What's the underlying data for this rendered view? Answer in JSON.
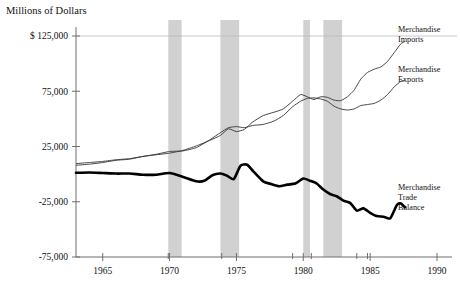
{
  "chart_data": {
    "type": "line",
    "title": "",
    "ylabel": "Millions of Dollars",
    "xlabel": "",
    "ylim": [
      -75000,
      125000
    ],
    "xlim": [
      1963,
      1990
    ],
    "grid": false,
    "legend_position": "right-inline",
    "y_ticks": [
      {
        "value": 125000,
        "label": "$ 125,000"
      },
      {
        "value": 75000,
        "label": "75,000"
      },
      {
        "value": 25000,
        "label": "25,000"
      },
      {
        "value": -25000,
        "label": "-25,000"
      },
      {
        "value": -75000,
        "label": "-75,000"
      }
    ],
    "x_ticks": [
      {
        "value": 1965,
        "label": "1965"
      },
      {
        "value": 1970,
        "label": "1970"
      },
      {
        "value": 1975,
        "label": "1975"
      },
      {
        "value": 1980,
        "label": "1980"
      },
      {
        "value": 1985,
        "label": "1985"
      },
      {
        "value": 1990,
        "label": "1990"
      }
    ],
    "x_minor_ticks": [
      1969.9,
      1973.9,
      1979.2,
      1980.6,
      1984.0,
      1984.8
    ],
    "recession_bands": [
      {
        "start": 1969.9,
        "end": 1970.9
      },
      {
        "start": 1973.8,
        "end": 1975.2
      },
      {
        "start": 1980.0,
        "end": 1980.5
      },
      {
        "start": 1981.5,
        "end": 1982.9
      }
    ],
    "series": [
      {
        "name": "Merchandise Imports",
        "label_lines": [
          "Merchandise",
          "Imports"
        ],
        "style": "thin",
        "x": [
          1963.0,
          1964.0,
          1965.0,
          1966.0,
          1967.0,
          1968.0,
          1969.0,
          1970.0,
          1971.0,
          1972.0,
          1973.0,
          1973.8,
          1974.4,
          1975.0,
          1975.6,
          1976.2,
          1977.0,
          1977.8,
          1978.5,
          1979.2,
          1979.8,
          1980.3,
          1980.8,
          1981.3,
          1981.8,
          1982.3,
          1982.8,
          1983.3,
          1983.8,
          1984.3,
          1984.8,
          1985.3,
          1985.8,
          1986.3,
          1986.8,
          1987.3,
          1987.6
        ],
        "y": [
          8000,
          9000,
          10500,
          12500,
          13500,
          16000,
          17500,
          19000,
          21500,
          25500,
          30500,
          35000,
          41000,
          38500,
          40500,
          47000,
          53000,
          56000,
          59000,
          66000,
          72000,
          70000,
          67500,
          70000,
          69500,
          67000,
          66500,
          70000,
          76000,
          86000,
          92000,
          95000,
          97000,
          102000,
          110000,
          118000,
          120000
        ]
      },
      {
        "name": "Merchandise Exports",
        "label_lines": [
          "Merchandise",
          "Exports"
        ],
        "style": "thin",
        "x": [
          1963.0,
          1964.0,
          1965.0,
          1966.0,
          1967.0,
          1968.0,
          1969.0,
          1970.0,
          1971.0,
          1972.0,
          1973.0,
          1973.8,
          1974.4,
          1975.0,
          1975.6,
          1976.2,
          1977.0,
          1977.8,
          1978.5,
          1979.2,
          1979.8,
          1980.3,
          1980.8,
          1981.3,
          1981.8,
          1982.3,
          1982.8,
          1983.3,
          1983.8,
          1984.3,
          1984.8,
          1985.3,
          1985.8,
          1986.3,
          1986.8,
          1987.3,
          1987.6
        ],
        "y": [
          9500,
          10500,
          11500,
          13000,
          14000,
          16000,
          18000,
          20500,
          21000,
          24000,
          31000,
          37500,
          42000,
          43000,
          42000,
          44000,
          45000,
          48000,
          53000,
          61000,
          66000,
          68500,
          69000,
          68000,
          66000,
          61500,
          59000,
          58000,
          59000,
          62000,
          63000,
          64000,
          67000,
          72000,
          79000,
          84000,
          85000
        ]
      },
      {
        "name": "Merchandise Trade Balance",
        "label_lines": [
          "Merchandise",
          "Trade",
          "Balance"
        ],
        "style": "thick",
        "x": [
          1963.0,
          1964.0,
          1965.0,
          1966.0,
          1967.0,
          1968.0,
          1969.0,
          1970.0,
          1971.0,
          1972.0,
          1972.6,
          1973.2,
          1973.8,
          1974.3,
          1974.8,
          1975.3,
          1975.8,
          1976.3,
          1977.0,
          1977.6,
          1978.2,
          1978.8,
          1979.4,
          1980.0,
          1980.5,
          1981.0,
          1981.5,
          1982.0,
          1982.5,
          1983.0,
          1983.5,
          1984.0,
          1984.5,
          1985.0,
          1985.5,
          1986.0,
          1986.5,
          1987.0,
          1987.3,
          1987.6
        ],
        "y": [
          1200,
          1500,
          1000,
          500,
          500,
          -500,
          -500,
          1000,
          -2500,
          -6500,
          -6000,
          -1000,
          500,
          -1500,
          -4500,
          7500,
          8500,
          2000,
          -6500,
          -9000,
          -11000,
          -9500,
          -8500,
          -4000,
          -6000,
          -8500,
          -14000,
          -18000,
          -20000,
          -24000,
          -26000,
          -33000,
          -31000,
          -35000,
          -38000,
          -38500,
          -40000,
          -28000,
          -26500,
          -30000
        ]
      }
    ]
  },
  "axis_title": "Millions of Dollars"
}
